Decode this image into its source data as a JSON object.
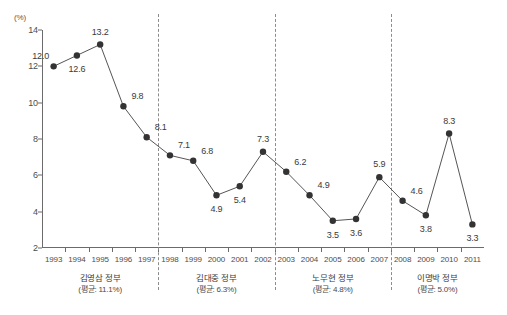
{
  "chart_data": {
    "type": "line",
    "title": "",
    "subtitle": "",
    "xlabel": "",
    "ylabel": "",
    "unit_label": "(%)",
    "grid": false,
    "legend": "none",
    "xlim": [
      1992.5,
      2011.5
    ],
    "ylim": [
      2,
      14
    ],
    "y_ticks": [
      2,
      4,
      6,
      8,
      10,
      12,
      14
    ],
    "categories": [
      1993,
      1994,
      1995,
      1996,
      1997,
      1998,
      1999,
      2000,
      2001,
      2002,
      2003,
      2004,
      2005,
      2006,
      2007,
      2008,
      2009,
      2010,
      2011
    ],
    "x_tick_labels": [
      "1993",
      "1994",
      "1995",
      "1996",
      "1997",
      "1998",
      "1999",
      "2000",
      "2001",
      "2002",
      "2003",
      "2004",
      "2005",
      "2006",
      "2007",
      "2008",
      "2009",
      "2010",
      "2011"
    ],
    "values": [
      12.0,
      12.6,
      13.2,
      9.8,
      8.1,
      7.1,
      6.8,
      4.9,
      5.4,
      7.3,
      6.2,
      4.9,
      3.5,
      3.6,
      5.9,
      4.6,
      3.8,
      8.3,
      3.3
    ],
    "point_labels": [
      {
        "year": 1993,
        "value": 12.0,
        "text": "12.0",
        "pos": "above-left"
      },
      {
        "year": 1994,
        "value": 12.6,
        "text": "12.6",
        "pos": "below"
      },
      {
        "year": 1995,
        "value": 13.2,
        "text": "13.2",
        "pos": "above"
      },
      {
        "year": 1996,
        "value": 9.8,
        "text": "9.8",
        "pos": "above-right"
      },
      {
        "year": 1997,
        "value": 8.1,
        "text": "8.1",
        "pos": "above-right"
      },
      {
        "year": 1998,
        "value": 7.1,
        "text": "7.1",
        "pos": "above-right"
      },
      {
        "year": 1999,
        "value": 6.8,
        "text": "6.8",
        "pos": "above-right"
      },
      {
        "year": 2000,
        "value": 4.9,
        "text": "4.9",
        "pos": "below"
      },
      {
        "year": 2001,
        "value": 5.4,
        "text": "5.4",
        "pos": "below"
      },
      {
        "year": 2002,
        "value": 7.3,
        "text": "7.3",
        "pos": "above"
      },
      {
        "year": 2003,
        "value": 6.2,
        "text": "6.2",
        "pos": "above-right"
      },
      {
        "year": 2004,
        "value": 4.9,
        "text": "4.9",
        "pos": "above-right"
      },
      {
        "year": 2005,
        "value": 3.5,
        "text": "3.5",
        "pos": "below"
      },
      {
        "year": 2006,
        "value": 3.6,
        "text": "3.6",
        "pos": "below"
      },
      {
        "year": 2007,
        "value": 5.9,
        "text": "5.9",
        "pos": "above"
      },
      {
        "year": 2008,
        "value": 4.6,
        "text": "4.6",
        "pos": "above-right"
      },
      {
        "year": 2009,
        "value": 3.8,
        "text": "3.8",
        "pos": "below"
      },
      {
        "year": 2010,
        "value": 8.3,
        "text": "8.3",
        "pos": "above"
      },
      {
        "year": 2011,
        "value": 3.3,
        "text": "3.3",
        "pos": "below"
      }
    ],
    "periods": [
      {
        "name": "김영삼 정부",
        "average_text": "(평균: 11.1%)",
        "start_year": 1993,
        "end_year": 1997,
        "average": 11.1
      },
      {
        "name": "김대중 정부",
        "average_text": "(평균: 6.3%)",
        "start_year": 1998,
        "end_year": 2002,
        "average": 6.3
      },
      {
        "name": "노무현 정부",
        "average_text": "(평균: 4.8%)",
        "start_year": 2003,
        "end_year": 2007,
        "average": 4.8
      },
      {
        "name": "이명박 정부",
        "average_text": "(평균: 5.0%)",
        "start_year": 2008,
        "end_year": 2011,
        "average": 5.0
      }
    ],
    "dividers": [
      1997.5,
      2002.5,
      2007.5
    ],
    "colors": {
      "line": "#555555",
      "marker": "#333333",
      "axis": "#6b6b6b",
      "divider": "#8c8c8c",
      "text": "#3a3a3a",
      "background": "#ffffff"
    }
  }
}
